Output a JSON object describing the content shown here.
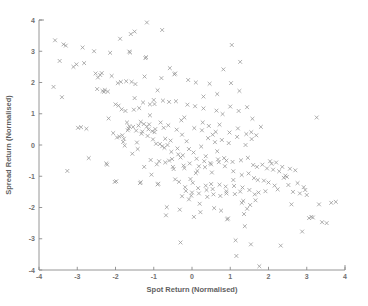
{
  "chart_data": {
    "type": "scatter",
    "title": "",
    "xlabel": "Spot Return (Normalised)",
    "ylabel": "Spread Return (Normalised)",
    "xlim": [
      -4,
      4
    ],
    "ylim": [
      -4,
      4
    ],
    "xticks": [
      -4,
      -3,
      -2,
      -1,
      0,
      1,
      2,
      3,
      4
    ],
    "yticks": [
      -4,
      -3,
      -2,
      -1,
      0,
      1,
      2,
      3,
      4
    ],
    "xtick_labels": [
      "-4",
      "-3",
      "-2",
      "-1",
      "0",
      "1",
      "2",
      "3",
      "4"
    ],
    "ytick_labels": [
      "-4",
      "-3",
      "-2",
      "-1",
      "0",
      "1",
      "2",
      "3",
      "4"
    ],
    "grid": false,
    "legend": false,
    "marker": "x",
    "marker_color": "#949494",
    "axis_color": "#8a8a8a",
    "background": "#ffffff",
    "n_points": 272,
    "series": [
      {
        "name": "observations",
        "points": [
          [
            -3.58,
            3.35
          ],
          [
            -3.62,
            1.86
          ],
          [
            -3.46,
            2.69
          ],
          [
            -3.4,
            1.53
          ],
          [
            -3.36,
            3.22
          ],
          [
            -3.3,
            3.18
          ],
          [
            -3.26,
            -0.83
          ],
          [
            -3.1,
            2.5
          ],
          [
            -3.02,
            2.58
          ],
          [
            -2.98,
            0.55
          ],
          [
            -2.9,
            0.57
          ],
          [
            -2.86,
            3.12
          ],
          [
            -2.82,
            2.62
          ],
          [
            -2.76,
            0.52
          ],
          [
            -2.7,
            -0.42
          ],
          [
            -2.56,
            3.0
          ],
          [
            -2.52,
            2.29
          ],
          [
            -2.46,
            2.16
          ],
          [
            -2.4,
            2.24
          ],
          [
            -2.36,
            2.3
          ],
          [
            -2.34,
            1.73
          ],
          [
            -2.28,
            1.76
          ],
          [
            -2.24,
            -0.59
          ],
          [
            -2.22,
            -0.63
          ],
          [
            -2.2,
            1.71
          ],
          [
            -2.18,
            0.85
          ],
          [
            -2.14,
            2.95
          ],
          [
            -2.1,
            2.21
          ],
          [
            -2.06,
            0.38
          ],
          [
            -2.02,
            -1.18
          ],
          [
            -1.98,
            -1.16
          ],
          [
            -1.94,
            1.98
          ],
          [
            -1.92,
            1.26
          ],
          [
            -1.9,
            0.27
          ],
          [
            -1.88,
            3.4
          ],
          [
            -1.86,
            2.02
          ],
          [
            -1.84,
            1.14
          ],
          [
            -1.82,
            0.31
          ],
          [
            -1.8,
            0.1
          ],
          [
            -1.78,
            0.2
          ],
          [
            -1.76,
            -0.02
          ],
          [
            -1.74,
            1.09
          ],
          [
            -1.72,
            2.04
          ],
          [
            -1.7,
            0.72
          ],
          [
            -1.68,
            0.47
          ],
          [
            -1.66,
            0.53
          ],
          [
            -1.64,
            2.99
          ],
          [
            -1.62,
            2.96
          ],
          [
            -1.6,
            3.55
          ],
          [
            -1.58,
            2.02
          ],
          [
            -1.56,
            -0.28
          ],
          [
            -1.54,
            0.58
          ],
          [
            -1.52,
            1.13
          ],
          [
            -1.5,
            3.63
          ],
          [
            -1.48,
            1.95
          ],
          [
            -1.46,
            0.46
          ],
          [
            -1.44,
            0.08
          ],
          [
            -1.42,
            -0.13
          ],
          [
            -1.4,
            0.62
          ],
          [
            -1.38,
            1.18
          ],
          [
            -1.36,
            -1.22
          ],
          [
            -1.34,
            -1.19
          ],
          [
            -1.32,
            0.36
          ],
          [
            -1.3,
            0.43
          ],
          [
            -1.28,
            1.36
          ],
          [
            -1.26,
            0.67
          ],
          [
            -1.24,
            2.19
          ],
          [
            -1.22,
            2.78
          ],
          [
            -1.2,
            2.81
          ],
          [
            -1.18,
            3.92
          ],
          [
            -1.16,
            0.29
          ],
          [
            -1.14,
            0.5
          ],
          [
            -1.12,
            0.66
          ],
          [
            -1.1,
            1.3
          ],
          [
            -1.08,
            -0.48
          ],
          [
            -1.06,
            -0.95
          ],
          [
            -1.04,
            0.44
          ],
          [
            -1.02,
            0.18
          ],
          [
            -1.0,
            1.44
          ],
          [
            -0.98,
            1.31
          ],
          [
            -0.96,
            0.51
          ],
          [
            -0.94,
            0.04
          ],
          [
            -0.92,
            -0.62
          ],
          [
            -0.9,
            -1.26
          ],
          [
            -0.88,
            -1.24
          ],
          [
            -0.86,
            -0.52
          ],
          [
            -0.84,
            0.03
          ],
          [
            -0.82,
            0.72
          ],
          [
            -0.8,
            2.14
          ],
          [
            -0.78,
            3.68
          ],
          [
            -0.76,
            1.42
          ],
          [
            -0.74,
            0.55
          ],
          [
            -0.72,
            -0.09
          ],
          [
            -0.7,
            -0.56
          ],
          [
            -0.68,
            -2.25
          ],
          [
            -0.66,
            -1.99
          ],
          [
            -0.64,
            0.0
          ],
          [
            -0.62,
            0.63
          ],
          [
            -0.6,
            1.38
          ],
          [
            -0.58,
            2.46
          ],
          [
            -0.56,
            0.14
          ],
          [
            -0.54,
            -0.22
          ],
          [
            -0.52,
            -0.45
          ],
          [
            -0.5,
            -0.7
          ],
          [
            -0.48,
            -0.77
          ],
          [
            -0.46,
            2.26
          ],
          [
            -0.44,
            2.29
          ],
          [
            -0.42,
            1.4
          ],
          [
            -0.4,
            0.49
          ],
          [
            -0.38,
            -0.11
          ],
          [
            -0.36,
            -0.3
          ],
          [
            -0.34,
            -1.18
          ],
          [
            -0.32,
            -2.07
          ],
          [
            -0.3,
            -3.12
          ],
          [
            -0.28,
            0.79
          ],
          [
            -0.26,
            0.33
          ],
          [
            -0.24,
            -0.33
          ],
          [
            -0.22,
            -0.66
          ],
          [
            -0.2,
            -0.74
          ],
          [
            -0.18,
            -1.35
          ],
          [
            -0.16,
            -1.47
          ],
          [
            -0.14,
            0.12
          ],
          [
            -0.12,
            1.29
          ],
          [
            -0.1,
            2.08
          ],
          [
            -0.08,
            -0.13
          ],
          [
            -0.06,
            -0.59
          ],
          [
            -0.04,
            -1.09
          ],
          [
            -0.02,
            -1.62
          ],
          [
            0.0,
            -1.52
          ],
          [
            0.02,
            -1.21
          ],
          [
            0.04,
            -0.24
          ],
          [
            0.06,
            0.54
          ],
          [
            0.08,
            1.24
          ],
          [
            0.1,
            2.0
          ],
          [
            0.12,
            -0.44
          ],
          [
            0.14,
            -0.83
          ],
          [
            0.16,
            -1.38
          ],
          [
            0.18,
            -1.55
          ],
          [
            0.2,
            -1.88
          ],
          [
            0.22,
            -2.15
          ],
          [
            0.24,
            -0.05
          ],
          [
            0.26,
            0.47
          ],
          [
            0.28,
            0.72
          ],
          [
            0.3,
            1.17
          ],
          [
            0.32,
            -0.52
          ],
          [
            0.34,
            -0.71
          ],
          [
            0.36,
            -1.3
          ],
          [
            0.38,
            -1.44
          ],
          [
            0.4,
            -1.66
          ],
          [
            0.42,
            0.22
          ],
          [
            0.44,
            0.61
          ],
          [
            0.46,
            1.96
          ],
          [
            0.48,
            -0.58
          ],
          [
            0.5,
            -0.62
          ],
          [
            0.52,
            -0.88
          ],
          [
            0.54,
            -1.41
          ],
          [
            0.56,
            -1.58
          ],
          [
            0.58,
            -2.02
          ],
          [
            0.6,
            0.09
          ],
          [
            0.62,
            0.42
          ],
          [
            0.64,
            1.1
          ],
          [
            0.66,
            1.63
          ],
          [
            0.68,
            -0.46
          ],
          [
            0.7,
            -0.55
          ],
          [
            0.72,
            -1.27
          ],
          [
            0.74,
            -1.63
          ],
          [
            0.76,
            -2.1
          ],
          [
            0.78,
            0.16
          ],
          [
            0.8,
            0.99
          ],
          [
            0.82,
            2.42
          ],
          [
            0.84,
            -0.42
          ],
          [
            0.86,
            -0.68
          ],
          [
            0.88,
            -1.33
          ],
          [
            0.9,
            -1.48
          ],
          [
            0.92,
            -2.38
          ],
          [
            0.94,
            -2.35
          ],
          [
            0.96,
            0.06
          ],
          [
            0.98,
            0.4
          ],
          [
            1.0,
            1.23
          ],
          [
            1.02,
            1.98
          ],
          [
            1.04,
            3.2
          ],
          [
            1.06,
            -0.54
          ],
          [
            1.08,
            -0.84
          ],
          [
            1.1,
            -1.31
          ],
          [
            1.12,
            -1.57
          ],
          [
            1.14,
            -3.05
          ],
          [
            1.16,
            -3.55
          ],
          [
            1.18,
            0.26
          ],
          [
            1.2,
            0.53
          ],
          [
            1.22,
            1.09
          ],
          [
            1.24,
            1.73
          ],
          [
            1.26,
            2.66
          ],
          [
            1.28,
            -0.49
          ],
          [
            1.3,
            -0.96
          ],
          [
            1.32,
            -1.36
          ],
          [
            1.34,
            -1.79
          ],
          [
            1.36,
            -2.21
          ],
          [
            1.38,
            -2.6
          ],
          [
            1.4,
            0.0
          ],
          [
            1.42,
            0.35
          ],
          [
            1.44,
            1.21
          ],
          [
            1.46,
            -0.41
          ],
          [
            1.48,
            -0.91
          ],
          [
            1.5,
            -1.44
          ],
          [
            1.52,
            -1.92
          ],
          [
            1.54,
            -3.18
          ],
          [
            1.56,
            0.19
          ],
          [
            1.58,
            0.84
          ],
          [
            1.6,
            -0.64
          ],
          [
            1.62,
            -1.06
          ],
          [
            1.64,
            -1.58
          ],
          [
            1.66,
            -1.77
          ],
          [
            1.68,
            0.31
          ],
          [
            1.7,
            -0.7
          ],
          [
            1.72,
            -1.12
          ],
          [
            1.74,
            -1.52
          ],
          [
            1.76,
            -3.88
          ],
          [
            1.8,
            0.58
          ],
          [
            1.84,
            -0.63
          ],
          [
            1.88,
            -1.14
          ],
          [
            1.92,
            -1.48
          ],
          [
            1.96,
            -0.75
          ],
          [
            2.0,
            -1.2
          ],
          [
            2.04,
            -0.52
          ],
          [
            2.08,
            -0.6
          ],
          [
            2.12,
            -0.79
          ],
          [
            2.16,
            -1.3
          ],
          [
            2.2,
            -0.56
          ],
          [
            2.24,
            -1.42
          ],
          [
            2.28,
            -0.84
          ],
          [
            2.32,
            -3.22
          ],
          [
            2.36,
            -0.7
          ],
          [
            2.4,
            -1.05
          ],
          [
            2.44,
            -0.98
          ],
          [
            2.48,
            -1.02
          ],
          [
            2.52,
            -1.28
          ],
          [
            2.56,
            -0.76
          ],
          [
            2.6,
            -1.9
          ],
          [
            2.64,
            -1.5
          ],
          [
            2.7,
            -0.81
          ],
          [
            2.76,
            -1.22
          ],
          [
            2.82,
            -1.55
          ],
          [
            2.88,
            -2.77
          ],
          [
            2.92,
            -1.35
          ],
          [
            2.96,
            -1.44
          ],
          [
            3.0,
            -1.6
          ],
          [
            3.06,
            -2.34
          ],
          [
            3.12,
            -2.3
          ],
          [
            3.16,
            -2.32
          ],
          [
            3.26,
            0.88
          ],
          [
            3.32,
            -1.9
          ],
          [
            3.4,
            -2.47
          ],
          [
            3.52,
            -2.5
          ],
          [
            3.64,
            -1.85
          ],
          [
            3.76,
            -1.82
          ],
          [
            -2.48,
            1.79
          ],
          [
            -2.3,
            1.7
          ],
          [
            -1.96,
            0.24
          ],
          [
            -1.64,
            0.6
          ],
          [
            -1.34,
            0.74
          ],
          [
            -1.18,
            0.59
          ],
          [
            -0.98,
            0.41
          ],
          [
            -0.78,
            -0.04
          ],
          [
            -0.6,
            -0.5
          ],
          [
            -0.44,
            -1.1
          ],
          [
            -0.26,
            -1.64
          ],
          [
            -0.08,
            -1.74
          ],
          [
            0.18,
            -0.68
          ],
          [
            0.36,
            -0.36
          ],
          [
            0.54,
            0.33
          ],
          [
            0.72,
            0.65
          ],
          [
            0.9,
            -0.5
          ],
          [
            1.08,
            -1.12
          ],
          [
            1.26,
            -1.49
          ],
          [
            1.44,
            -2.04
          ],
          [
            -1.5,
            1.5
          ],
          [
            -1.1,
            0.95
          ],
          [
            -0.7,
            0.2
          ],
          [
            -0.3,
            -0.4
          ],
          [
            0.1,
            -0.9
          ],
          [
            0.5,
            -1.25
          ],
          [
            0.9,
            -1.55
          ],
          [
            1.3,
            -1.85
          ],
          [
            -2.0,
            1.3
          ],
          [
            -0.9,
            1.75
          ],
          [
            0.3,
            1.55
          ],
          [
            1.55,
            0.41
          ],
          [
            -0.2,
            0.88
          ],
          [
            0.66,
            -0.2
          ],
          [
            -1.25,
            -0.7
          ],
          [
            0.05,
            -2.3
          ]
        ]
      }
    ]
  },
  "axes_geometry": {
    "left": 39,
    "right": 345,
    "top": 20,
    "bottom": 270
  }
}
